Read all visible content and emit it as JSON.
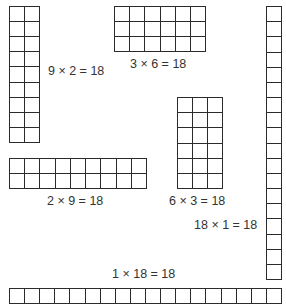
{
  "diagram": {
    "title": "",
    "arrays": [
      {
        "id": "9x2",
        "rows": 9,
        "cols": 2,
        "label": "9 × 2 = 18"
      },
      {
        "id": "3x6",
        "rows": 3,
        "cols": 6,
        "label": "3 × 6 = 18"
      },
      {
        "id": "18x1",
        "rows": 18,
        "cols": 1,
        "label": "18 × 1 = 18"
      },
      {
        "id": "2x9",
        "rows": 2,
        "cols": 9,
        "label": "2 × 9 = 18"
      },
      {
        "id": "6x3",
        "rows": 6,
        "cols": 3,
        "label": "6 × 3 = 18"
      },
      {
        "id": "1x18",
        "rows": 1,
        "cols": 18,
        "label": "1 × 18 = 18"
      }
    ],
    "colors": {
      "line": "#2b2b2b",
      "text": "#333333",
      "background": "#ffffff"
    }
  }
}
